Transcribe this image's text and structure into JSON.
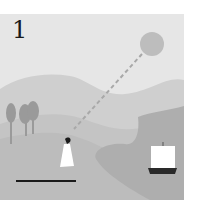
{
  "panel": {
    "number": "1",
    "colors": {
      "sky": "#e6e6e6",
      "sun": "#bdbdbd",
      "far_hill": "#cfcfcf",
      "mid_hill": "#c4c4c4",
      "foreground": "#bcbcbc",
      "sea": "#aeaeae",
      "tree": "#9a9a9a",
      "figure_robe": "#ffffff",
      "figure_hair": "#1a1a1a",
      "shadow": "#1a1a1a",
      "sail": "#ffffff",
      "hull": "#2a2a2a",
      "sight_line": "#a8a8a8"
    },
    "elements": [
      "number-label",
      "sun",
      "sight-line",
      "trees",
      "hills",
      "sea",
      "person",
      "shadow",
      "ship"
    ]
  }
}
